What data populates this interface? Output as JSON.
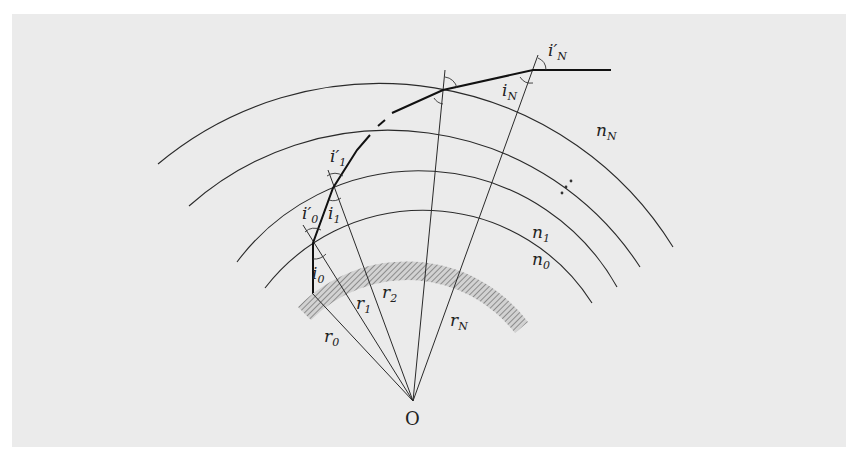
{
  "figure": {
    "center_label": "O",
    "radius_labels": [
      "r0",
      "r1",
      "r2",
      "rN"
    ],
    "index_labels": [
      "n0",
      "n1",
      "nN"
    ],
    "angle_labels": {
      "i0": "i",
      "i0_sub": "0",
      "i0p": "i′",
      "i0p_sub": "0",
      "i1": "i",
      "i1_sub": "1",
      "i1p": "i′",
      "i1p_sub": "1",
      "iN": "i",
      "iN_sub": "N",
      "iNp": "i′",
      "iNp_sub": "N"
    },
    "ellipsis": "⋰",
    "colors": {
      "panel": "#ebebeb",
      "lines": "#222222",
      "hatch": "#8a8a8a"
    }
  }
}
